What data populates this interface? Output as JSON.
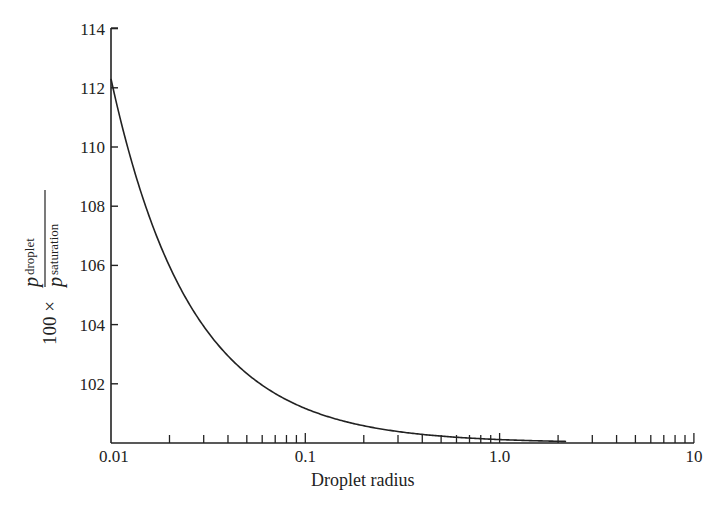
{
  "chart_data": {
    "type": "line",
    "title": "",
    "xlabel": "Droplet radius",
    "ylabel": "100 × p_droplet / p_saturation",
    "ylabel_parts": {
      "prefix": "100 ×",
      "numerator_symbol": "p",
      "numerator_sub": "droplet",
      "denominator_symbol": "p",
      "denominator_sub": "saturation"
    },
    "x_scale": "log",
    "xlim": [
      0.01,
      10
    ],
    "ylim": [
      100,
      114
    ],
    "x_tick_labels": [
      "0.01",
      "0.1",
      "1.0",
      "10"
    ],
    "x_tick_values": [
      0.01,
      0.1,
      1.0,
      10
    ],
    "x_minor_ticks": [
      0.02,
      0.03,
      0.04,
      0.05,
      0.06,
      0.07,
      0.08,
      0.09,
      0.2,
      0.3,
      0.4,
      0.5,
      0.6,
      0.7,
      0.8,
      0.9,
      2,
      3,
      4,
      5,
      6,
      7,
      8,
      9
    ],
    "y_tick_labels": [
      "102",
      "104",
      "106",
      "108",
      "110",
      "112",
      "114"
    ],
    "y_tick_values": [
      102,
      104,
      106,
      108,
      110,
      112,
      114
    ],
    "grid": false,
    "legend": null,
    "series": [
      {
        "name": "Kelvin curve",
        "x": [
          0.01,
          0.012,
          0.015,
          0.02,
          0.025,
          0.03,
          0.04,
          0.05,
          0.06,
          0.07,
          0.08,
          0.1,
          0.15,
          0.2,
          0.3,
          0.5,
          0.7,
          1.0,
          2.0
        ],
        "values": [
          112.3,
          110.2,
          108.1,
          106.0,
          104.7,
          103.9,
          102.9,
          102.3,
          101.95,
          101.67,
          101.46,
          101.17,
          100.78,
          100.58,
          100.39,
          100.23,
          100.17,
          100.12,
          100.06
        ]
      }
    ]
  }
}
